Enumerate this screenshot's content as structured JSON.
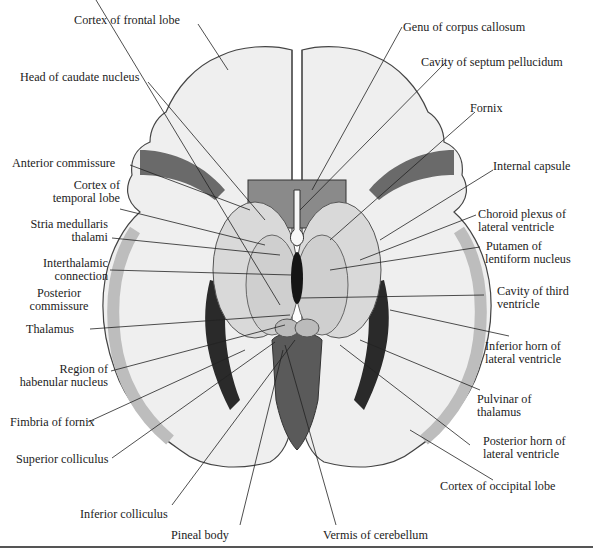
{
  "figure": {
    "labels": {
      "cortex_frontal": "Cortex of frontal lobe",
      "genu_cc": "Genu of corpus callosum",
      "head_caudate": "Head of caudate nucleus",
      "cavity_septum": "Cavity of septum pellucidum",
      "fornix": "Fornix",
      "anterior_commissure": "Anterior commissure",
      "internal_capsule": "Internal capsule",
      "cortex_temporal_1": "Cortex of",
      "cortex_temporal_2": "temporal lobe",
      "choroid_1": "Choroid plexus of",
      "choroid_2": "lateral ventricle",
      "stria_1": "Stria medullaris",
      "stria_2": "thalami",
      "putamen_1": "Putamen of",
      "putamen_2": "lentiform nucleus",
      "interthal_1": "Interthalamic",
      "interthal_2": "connection",
      "third_vent_1": "Cavity of third",
      "third_vent_2": "ventricle",
      "post_comm_1": "Posterior",
      "post_comm_2": "commissure",
      "thalamus": "Thalamus",
      "inf_horn_1": "Inferior horn of",
      "inf_horn_2": "lateral ventricle",
      "habenular_1": "Region of",
      "habenular_2": "habenular nucleus",
      "pulvinar_1": "Pulvinar of",
      "pulvinar_2": "thalamus",
      "fimbria": "Fimbria of fornix",
      "post_horn_1": "Posterior horn of",
      "post_horn_2": "lateral ventricle",
      "sup_colliculus": "Superior colliculus",
      "cortex_occipital": "Cortex of occipital lobe",
      "inf_colliculus": "Inferior colliculus",
      "pineal": "Pineal body",
      "vermis": "Vermis of cerebellum"
    },
    "colors": {
      "gray_matter": "#bdbdbd",
      "white_matter": "#f4f4f4",
      "dark_tissue": "#5a5a5a",
      "ventricle": "#1e1e1e",
      "leader_line": "#222222"
    }
  }
}
